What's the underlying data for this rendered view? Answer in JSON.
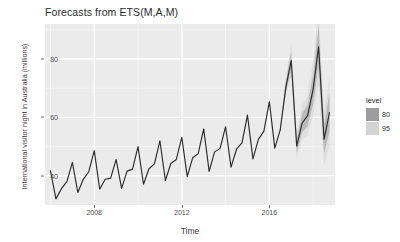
{
  "chart_data": {
    "type": "line",
    "title": "Forecasts from ETS(M,A,M)",
    "xlabel": "Time",
    "ylabel": "International visitor night in Australia (millions)",
    "xlim": [
      2005.75,
      2019.0
    ],
    "ylim": [
      30.0,
      92.0
    ],
    "x_ticks": [
      2008,
      2012,
      2016
    ],
    "y_ticks": [
      40,
      60,
      80
    ],
    "grid": true,
    "legend": {
      "title": "level",
      "position": "right",
      "entries": [
        {
          "label": "80",
          "color": "#9d9d9d"
        },
        {
          "label": "95",
          "color": "#d3d3d3"
        }
      ]
    },
    "series": [
      {
        "name": "observed",
        "color": "#2b2b2b",
        "x": [
          2006.0,
          2006.25,
          2006.5,
          2006.75,
          2007.0,
          2007.25,
          2007.5,
          2007.75,
          2008.0,
          2008.25,
          2008.5,
          2008.75,
          2009.0,
          2009.25,
          2009.5,
          2009.75,
          2010.0,
          2010.25,
          2010.5,
          2010.75,
          2011.0,
          2011.25,
          2011.5,
          2011.75,
          2012.0,
          2012.25,
          2012.5,
          2012.75,
          2013.0,
          2013.25,
          2013.5,
          2013.75,
          2014.0,
          2014.25,
          2014.5,
          2014.75,
          2015.0,
          2015.25,
          2015.5,
          2015.75,
          2016.0,
          2016.25,
          2016.5
        ],
        "y": [
          41.7,
          32.1,
          35.6,
          38.0,
          44.6,
          34.3,
          38.8,
          41.4,
          48.6,
          35.4,
          38.8,
          39.2,
          45.6,
          35.7,
          41.6,
          42.3,
          50.0,
          37.1,
          42.4,
          44.1,
          52.0,
          38.4,
          44.2,
          45.6,
          53.2,
          39.7,
          46.2,
          47.6,
          56.1,
          41.5,
          48.2,
          49.4,
          56.8,
          43.0,
          49.1,
          51.3,
          60.8,
          45.8,
          52.5,
          55.3,
          65.4,
          49.5,
          55.8
        ]
      },
      {
        "name": "forecast-mean",
        "color": "#2b2b2b",
        "x": [
          2016.5,
          2016.75,
          2017.0,
          2017.25,
          2017.5,
          2017.75,
          2018.0,
          2018.25,
          2018.5,
          2018.75
        ],
        "y": [
          55.8,
          70.2,
          79.5,
          50.2,
          58.1,
          60.6,
          69.6,
          84.2,
          52.5,
          61.7
        ]
      }
    ],
    "intervals": [
      {
        "level": 95,
        "color": "#d3d3d3",
        "x": [
          2016.5,
          2016.75,
          2017.0,
          2017.25,
          2017.5,
          2017.75,
          2018.0,
          2018.25,
          2018.5,
          2018.75
        ],
        "lower": [
          55.8,
          66.8,
          74.0,
          46.0,
          52.4,
          54.0,
          60.4,
          71.6,
          43.6,
          50.2
        ],
        "upper": [
          55.8,
          73.6,
          85.2,
          54.6,
          64.2,
          67.6,
          79.4,
          97.4,
          62.0,
          74.2
        ]
      },
      {
        "level": 80,
        "color": "#9d9d9d",
        "x": [
          2016.5,
          2016.75,
          2017.0,
          2017.25,
          2017.5,
          2017.75,
          2018.0,
          2018.25,
          2018.5,
          2018.75
        ],
        "lower": [
          55.8,
          68.3,
          76.4,
          47.9,
          55.0,
          57.0,
          64.6,
          77.5,
          47.8,
          55.2
        ],
        "upper": [
          55.8,
          72.1,
          82.7,
          52.6,
          61.3,
          64.3,
          74.8,
          91.1,
          57.4,
          68.6
        ]
      }
    ]
  },
  "panel": {
    "background": "#ebebeb",
    "gridline_color": "#ffffff"
  }
}
